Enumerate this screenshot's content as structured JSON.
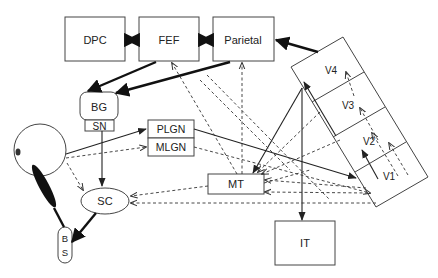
{
  "diagram": {
    "type": "neuroanatomy pathway diagram (visual / oculomotor system)",
    "nodes": {
      "dpc": "DPC",
      "fef": "FEF",
      "parietal": "Parietal",
      "bg": "BG",
      "sn": "SN",
      "plgn": "PLGN",
      "mlgn": "MLGN",
      "mt": "MT",
      "it": "IT",
      "sc": "SC",
      "bs_b": "B",
      "bs_s": "S",
      "v4": "V4",
      "v3": "V3",
      "v2": "V2",
      "v1": "V1",
      "eye": ""
    },
    "edges": [
      {
        "from": "DPC",
        "to": "FEF",
        "style": "thick",
        "direction": "both"
      },
      {
        "from": "FEF",
        "to": "Parietal",
        "style": "thick",
        "direction": "both"
      },
      {
        "from": "V-areas",
        "to": "Parietal",
        "style": "thick"
      },
      {
        "from": "FEF",
        "to": "BG",
        "style": "thick"
      },
      {
        "from": "Parietal",
        "to": "BG",
        "style": "thick"
      },
      {
        "from": "SN",
        "to": "SC",
        "style": "solid"
      },
      {
        "from": "SC",
        "to": "BS",
        "style": "thick"
      },
      {
        "from": "Eye",
        "to": "PLGN",
        "style": "solid"
      },
      {
        "from": "Eye",
        "to": "MLGN",
        "style": "dashed"
      },
      {
        "from": "Eye",
        "to": "SC",
        "style": "dashed"
      },
      {
        "from": "PLGN",
        "to": "V1",
        "style": "solid"
      },
      {
        "from": "MLGN",
        "to": "V1",
        "style": "dashed"
      },
      {
        "from": "V-areas",
        "to": "MT",
        "style": "solid"
      },
      {
        "from": "V-areas",
        "to": "IT",
        "style": "solid"
      },
      {
        "from": "MT",
        "to": "FEF",
        "style": "dashed"
      },
      {
        "from": "MT",
        "to": "Parietal",
        "style": "dashed"
      },
      {
        "from": "MT",
        "to": "SC",
        "style": "dashed"
      },
      {
        "from": "V1",
        "to": "SC",
        "style": "dashed"
      },
      {
        "from": "V1",
        "to": "MT",
        "style": "dashed"
      },
      {
        "from": "V2",
        "to": "MT",
        "style": "dashed"
      },
      {
        "from": "V1",
        "to": "V2",
        "style": "solid"
      },
      {
        "from": "V3",
        "to": "V4",
        "style": "solid"
      },
      {
        "from": "V1",
        "to": "V2",
        "style": "dashed"
      },
      {
        "from": "V2",
        "to": "V3",
        "style": "dashed"
      },
      {
        "from": "V3",
        "to": "V4",
        "style": "dashed"
      }
    ]
  }
}
